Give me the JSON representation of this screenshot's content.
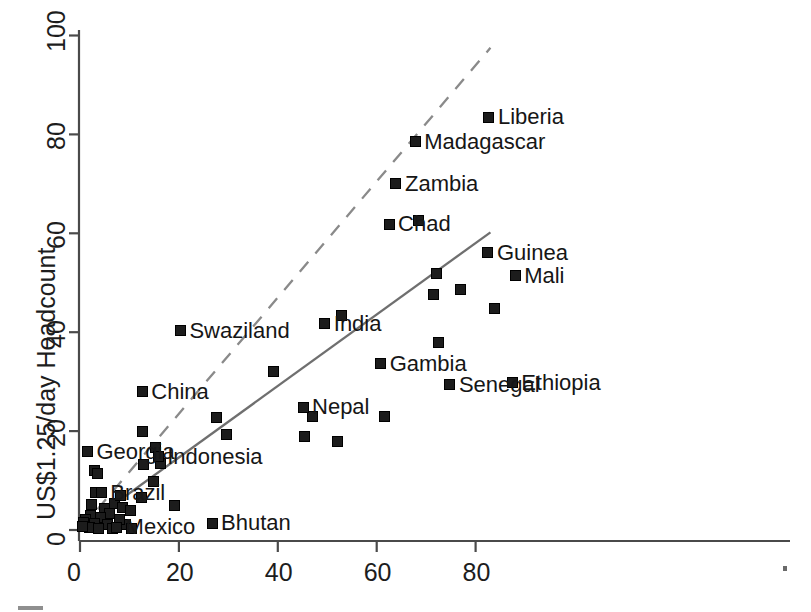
{
  "chart_data": {
    "type": "scatter",
    "title": "",
    "xlabel": "",
    "ylabel": "US$1.25/day Headcount",
    "xlim": [
      0,
      88
    ],
    "ylim": [
      0,
      100
    ],
    "xticks": [
      0,
      20,
      40,
      60,
      80
    ],
    "yticks": [
      0,
      20,
      40,
      60,
      80,
      100
    ],
    "grid": false,
    "legend": "none",
    "marker": "filled-square",
    "marker_color": "#1c1c1c",
    "trendlines": [
      {
        "name": "dashed-reference-line",
        "style": "dashed",
        "color": "#8a8a8a",
        "x": [
          0.4,
          83
        ],
        "y": [
          0.5,
          97.5
        ]
      },
      {
        "name": "solid-fit-line",
        "style": "solid",
        "color": "#6f6f6f",
        "x": [
          0.4,
          83
        ],
        "y": [
          0.5,
          60.2
        ]
      }
    ],
    "labeled_points": [
      {
        "label": "Liberia",
        "x": 82.7,
        "y": 83.5
      },
      {
        "label": "Madagascar",
        "x": 67.8,
        "y": 78.5
      },
      {
        "label": "Zambia",
        "x": 63.9,
        "y": 70.0
      },
      {
        "label": "Chad",
        "x": 62.5,
        "y": 61.8
      },
      {
        "label": "Guinea",
        "x": 82.5,
        "y": 56.1
      },
      {
        "label": "Mali",
        "x": 88.0,
        "y": 51.4
      },
      {
        "label": "India",
        "x": 49.5,
        "y": 41.7
      },
      {
        "label": "Swaziland",
        "x": 20.3,
        "y": 40.3
      },
      {
        "label": "Gambia",
        "x": 60.8,
        "y": 33.6
      },
      {
        "label": "Senegal",
        "x": 74.8,
        "y": 29.4
      },
      {
        "label": "Ethiopia",
        "x": 87.4,
        "y": 29.8
      },
      {
        "label": "China",
        "x": 12.6,
        "y": 28.0
      },
      {
        "label": "Nepal",
        "x": 45.1,
        "y": 24.8
      },
      {
        "label": "Indonesia",
        "x": 15.8,
        "y": 14.8
      },
      {
        "label": "Georgia",
        "x": 1.5,
        "y": 15.8
      },
      {
        "label": "Brazil",
        "x": 4.3,
        "y": 7.5
      },
      {
        "label": "Mexico",
        "x": 7.4,
        "y": 0.6
      },
      {
        "label": "Bhutan",
        "x": 26.7,
        "y": 1.4
      }
    ],
    "unlabeled_points": [
      {
        "x": 68.4,
        "y": 62.6
      },
      {
        "x": 72.1,
        "y": 51.9
      },
      {
        "x": 76.9,
        "y": 48.7
      },
      {
        "x": 71.4,
        "y": 47.6
      },
      {
        "x": 83.9,
        "y": 44.8
      },
      {
        "x": 52.8,
        "y": 43.4
      },
      {
        "x": 72.4,
        "y": 38.0
      },
      {
        "x": 39.2,
        "y": 32.1
      },
      {
        "x": 61.5,
        "y": 22.9
      },
      {
        "x": 47.1,
        "y": 22.9
      },
      {
        "x": 27.6,
        "y": 22.7
      },
      {
        "x": 45.4,
        "y": 18.9
      },
      {
        "x": 52.0,
        "y": 17.8
      },
      {
        "x": 29.7,
        "y": 19.3
      },
      {
        "x": 12.6,
        "y": 19.9
      },
      {
        "x": 15.3,
        "y": 16.7
      },
      {
        "x": 12.9,
        "y": 13.3
      },
      {
        "x": 16.3,
        "y": 13.5
      },
      {
        "x": 3.0,
        "y": 12.1
      },
      {
        "x": 3.6,
        "y": 11.4
      },
      {
        "x": 14.8,
        "y": 9.9
      },
      {
        "x": 3.2,
        "y": 7.6
      },
      {
        "x": 12.4,
        "y": 6.6
      },
      {
        "x": 19.2,
        "y": 5.0
      },
      {
        "x": 7.0,
        "y": 5.4
      },
      {
        "x": 8.6,
        "y": 4.6
      },
      {
        "x": 5.0,
        "y": 4.3
      },
      {
        "x": 6.0,
        "y": 3.4
      },
      {
        "x": 2.2,
        "y": 3.0
      },
      {
        "x": 4.2,
        "y": 2.6
      },
      {
        "x": 1.2,
        "y": 2.2
      },
      {
        "x": 0.7,
        "y": 1.6
      },
      {
        "x": 2.9,
        "y": 1.3
      },
      {
        "x": 5.6,
        "y": 1.1
      },
      {
        "x": 9.2,
        "y": 1.2
      },
      {
        "x": 7.9,
        "y": 2.1
      },
      {
        "x": 1.9,
        "y": 0.5
      },
      {
        "x": 3.8,
        "y": 0.4
      },
      {
        "x": 6.6,
        "y": 0.3
      },
      {
        "x": 0.5,
        "y": 0.8
      },
      {
        "x": 10.5,
        "y": 0.4
      },
      {
        "x": 8.2,
        "y": 7.0
      },
      {
        "x": 10.2,
        "y": 4.0
      },
      {
        "x": 2.4,
        "y": 5.1
      }
    ]
  },
  "axes": {
    "x_tick_labels": [
      "0",
      "20",
      "40",
      "60",
      "80"
    ],
    "y_tick_labels": [
      "0",
      "20",
      "40",
      "60",
      "80",
      "100"
    ],
    "y_axis_title": "US$1.25/day Headcount"
  },
  "artifacts": {
    "corner_mark": "scan-artifact-mark",
    "edge_mark": "scan-artifact-dot"
  }
}
